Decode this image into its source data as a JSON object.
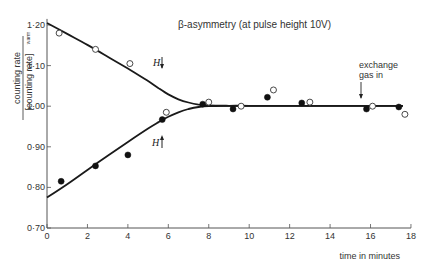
{
  "chart_data": {
    "type": "scatter",
    "title": "β-asymmetry  (at pulse height 10V)",
    "xlabel": "time in minutes",
    "ylabel_numerator": "counting rate",
    "ylabel_denominator": "[counting rate]",
    "ylabel_subscript": "warm",
    "xlim": [
      0,
      18
    ],
    "ylim": [
      0.7,
      1.22
    ],
    "x_ticks": [
      0,
      2,
      4,
      6,
      8,
      10,
      12,
      14,
      16,
      18
    ],
    "x_tick_labels": [
      "0",
      "2",
      "4",
      "6",
      "8",
      "10",
      "12",
      "14",
      "16",
      "18"
    ],
    "y_ticks": [
      0.7,
      0.8,
      0.9,
      1.0,
      1.1,
      1.2
    ],
    "y_tick_labels": [
      "0·70",
      "0·80",
      "0·90",
      "1·00",
      "1·10",
      "1·20"
    ],
    "grid": false,
    "series": [
      {
        "name": "H down (open circles)",
        "marker": "open-circle",
        "x": [
          0.6,
          2.4,
          4.1,
          5.9,
          8.0,
          9.6,
          11.2,
          13.0,
          16.1,
          17.7
        ],
        "y": [
          1.18,
          1.14,
          1.105,
          0.985,
          1.01,
          1.0,
          1.04,
          1.01,
          1.0,
          0.98
        ]
      },
      {
        "name": "H up (filled circles)",
        "marker": "filled-circle",
        "x": [
          0.7,
          2.4,
          4.0,
          5.7,
          7.7,
          9.2,
          10.9,
          12.6,
          15.8,
          17.4
        ],
        "y": [
          0.815,
          0.853,
          0.88,
          0.967,
          1.005,
          0.993,
          1.022,
          1.008,
          0.993,
          0.998
        ]
      }
    ],
    "fit_curves": [
      {
        "name": "upper relaxation curve",
        "x": [
          0,
          1,
          2,
          3,
          4,
          5,
          5.5,
          6,
          6.5,
          7,
          7.5,
          8,
          9,
          10,
          12,
          14,
          16,
          17.6
        ],
        "y": [
          1.205,
          1.178,
          1.151,
          1.122,
          1.093,
          1.062,
          1.045,
          1.029,
          1.017,
          1.009,
          1.004,
          1.002,
          1.001,
          1.001,
          1.001,
          1.001,
          1.001,
          1.001
        ]
      },
      {
        "name": "lower relaxation curve",
        "x": [
          0,
          1,
          2,
          3,
          4,
          5,
          5.5,
          6,
          6.5,
          7,
          7.5,
          8,
          9,
          10,
          12,
          14,
          16,
          17.6
        ],
        "y": [
          0.775,
          0.808,
          0.843,
          0.878,
          0.912,
          0.945,
          0.96,
          0.974,
          0.985,
          0.993,
          0.998,
          1.0,
          1.001,
          1.001,
          1.001,
          1.001,
          1.001,
          1.001
        ]
      }
    ],
    "annotations": [
      {
        "text": "H",
        "direction": "down",
        "x": 5.8,
        "y": 1.1
      },
      {
        "text": "H",
        "direction": "up",
        "x": 5.8,
        "y": 0.905
      },
      {
        "text": "exchange gas in",
        "arrow_x": 15.6,
        "arrow_from_y": 1.065,
        "arrow_to_y": 1.012
      }
    ]
  },
  "labels": {
    "title": "β-asymmetry  (at pulse height 10V)",
    "xlabel": "time in minutes",
    "ylabel_num": "counting rate",
    "ylabel_den": "[counting rate]",
    "ylabel_sub": "warm",
    "h_label": "H",
    "exchange_line1": "exchange",
    "exchange_line2": "gas in"
  }
}
